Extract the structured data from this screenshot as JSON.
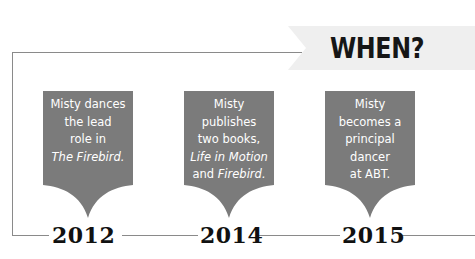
{
  "header": {
    "title": "WHEN?"
  },
  "colors": {
    "box_fill": "#7b7b7b",
    "banner_fill": "#efefef",
    "line": "#8a8a8a",
    "text_dark": "#111111",
    "text_light": "#ffffff"
  },
  "timeline": {
    "events": [
      {
        "year": "2012",
        "lines": [
          "Misty dances",
          "the lead",
          "role in"
        ],
        "italic_line": "The Firebird.",
        "trailing": ""
      },
      {
        "year": "2014",
        "lines": [
          "Misty",
          "publishes",
          "two books,"
        ],
        "italic_line": "Life in Motion",
        "trailing_prefix": "and ",
        "trailing_italic": "Firebird."
      },
      {
        "year": "2015",
        "lines": [
          "Misty",
          "becomes a",
          "principal",
          "dancer",
          "at ABT."
        ]
      }
    ]
  }
}
